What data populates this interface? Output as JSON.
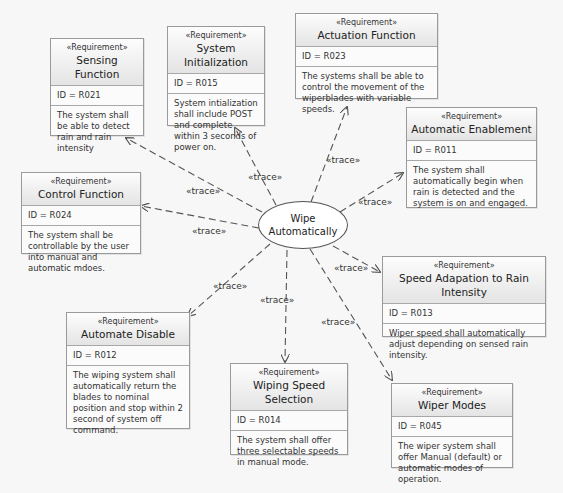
{
  "diagram": {
    "use_case": {
      "line1": "Wipe",
      "line2": "Automatically"
    },
    "stereotype": "«Requirement»",
    "trace_label": "«trace»",
    "requirements": [
      {
        "key": "sensing",
        "title": "Sensing Function",
        "id": "ID = R021",
        "text": "The system shall be able to detect rain and rain intensity"
      },
      {
        "key": "init",
        "title": "System Initialization",
        "id": "ID = R015",
        "text": "System intialization shall include POST and complete within 3 seconds of power on."
      },
      {
        "key": "actuation",
        "title": "Actuation Function",
        "id": "ID = R023",
        "text": "The systems shall be able to control the movement of the wiperblades with variable speeds."
      },
      {
        "key": "enablement",
        "title": "Automatic Enablement",
        "id": "ID = R011",
        "text": "The system shall automatically begin when rain is detected and the system is on and engaged."
      },
      {
        "key": "control",
        "title": "Control Function",
        "id": "ID = R024",
        "text": "The system shall be controllable by the user into manual and automatic mdoes."
      },
      {
        "key": "speed_adapt",
        "title": "Speed Adapation to Rain Intensity",
        "id": "ID = R013",
        "text": "Wiper speed shall automatically adjust depending on sensed rain intensity."
      },
      {
        "key": "disable",
        "title": "Automate Disable",
        "id": "ID = R012",
        "text": "The wiping system shall automatically return the blades to nominal position and stop within 2 second of  system off command."
      },
      {
        "key": "speed_select",
        "title": "Wiping Speed Selection",
        "id": "ID = R014",
        "text": "The system shall offer three selectable speeds in manual mode."
      },
      {
        "key": "modes",
        "title": "Wiper Modes",
        "id": "ID = R045",
        "text": "The wiper system shall offer Manual (default) or automatic modes of operation."
      }
    ],
    "traces": [
      {
        "label": "«trace»"
      },
      {
        "label": "«trace»"
      },
      {
        "label": "«trace»"
      },
      {
        "label": "«trace»"
      },
      {
        "label": "«trace»"
      },
      {
        "label": "«trace»"
      },
      {
        "label": "«trace»"
      },
      {
        "label": "«trace»"
      },
      {
        "label": "«trace»"
      }
    ]
  }
}
